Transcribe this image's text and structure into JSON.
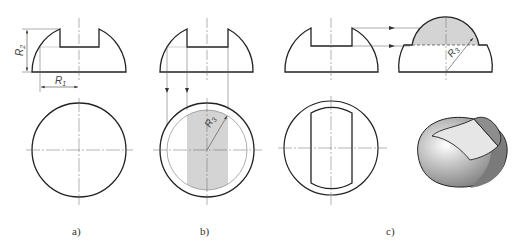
{
  "figure": {
    "panels": [
      {
        "id": "a",
        "caption": "a)"
      },
      {
        "id": "b",
        "caption": "b)"
      },
      {
        "id": "c",
        "caption": "c)"
      }
    ],
    "dimensions": {
      "r1_label": "R",
      "r1_sub": "1",
      "r2_label": "R",
      "r2_sub": "2",
      "r3_label": "R",
      "r3_sub": "3"
    },
    "colors": {
      "line": "#222222",
      "thin": "#555555",
      "section_fill": "#d4d4d4",
      "shade_dark": "#7a7a7a",
      "shade_mid": "#9b9b9b",
      "shade_light": "#e6e6e6"
    }
  }
}
